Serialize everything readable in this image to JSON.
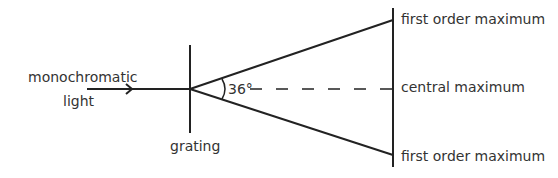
{
  "diagram": {
    "labels": {
      "source_line1": "monochromatic",
      "source_line2": "light",
      "grating": "grating",
      "angle": "36°",
      "top_max": "first order maximum",
      "central_max": "central maximum",
      "bottom_max": "first order maximum"
    }
  }
}
